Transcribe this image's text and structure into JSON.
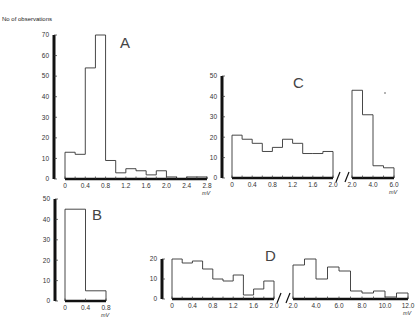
{
  "figure": {
    "ylabel": "No of observations",
    "unit": "mV"
  },
  "chart_data": [
    {
      "panel": "A",
      "type": "bar",
      "title": "A",
      "xlabel": "mV",
      "ylabel": "No of observations",
      "bin_width": 0.2,
      "categories": [
        "0-0.2",
        "0.2-0.4",
        "0.4-0.6",
        "0.6-0.8",
        "0.8-1.0",
        "1.0-1.2",
        "1.2-1.4",
        "1.4-1.6",
        "1.6-1.8",
        "1.8-2.0",
        "2.0-2.2",
        "2.2-2.4",
        "2.4-2.6",
        "2.6-2.8"
      ],
      "values": [
        13,
        12,
        54,
        70,
        9,
        3,
        5,
        4,
        2,
        4,
        1,
        0,
        1,
        1
      ],
      "xticks": [
        "0",
        "0.4",
        "0.8",
        "1.2",
        "1.6",
        "2.0",
        "2.4",
        "2.8"
      ],
      "yticks": [
        "0",
        "10",
        "20",
        "30",
        "40",
        "50",
        "60",
        "70"
      ],
      "ylim": [
        0,
        70
      ],
      "xlim": [
        0,
        2.8
      ]
    },
    {
      "panel": "B",
      "type": "bar",
      "title": "B",
      "xlabel": "mV",
      "bin_width": 0.4,
      "categories": [
        "0-0.4",
        "0.4-0.8"
      ],
      "values": [
        45,
        5
      ],
      "xticks": [
        "0",
        "0.4",
        "0.8"
      ],
      "yticks": [
        "0",
        "10",
        "20",
        "30",
        "40",
        "50"
      ],
      "ylim": [
        0,
        50
      ],
      "xlim": [
        0,
        0.8
      ]
    },
    {
      "panel": "C",
      "type": "bar",
      "title": "C",
      "xlabel": "mV",
      "broken_axis": true,
      "segments": [
        {
          "range": [
            0,
            2.0
          ],
          "bin_width": 0.2,
          "categories": [
            "0-0.2",
            "0.2-0.4",
            "0.4-0.6",
            "0.6-0.8",
            "0.8-1.0",
            "1.0-1.2",
            "1.2-1.4",
            "1.4-1.6",
            "1.6-1.8",
            "1.8-2.0"
          ],
          "values": [
            21,
            19,
            17,
            13,
            15,
            19,
            17,
            12,
            12,
            13
          ],
          "xticks": [
            "0",
            "0.4",
            "0.8",
            "1.2",
            "1.6",
            "2.0"
          ]
        },
        {
          "range": [
            2.0,
            6.0
          ],
          "bin_width": 1.0,
          "categories": [
            "2.0-3.0",
            "3.0-4.0",
            "4.0-5.0",
            "5.0-6.0"
          ],
          "values": [
            43,
            31,
            6,
            5
          ],
          "xticks": [
            "2.0",
            "4.0",
            "6.0"
          ]
        }
      ],
      "yticks": [
        "0",
        "10",
        "20",
        "30",
        "40",
        "50"
      ],
      "ylim": [
        0,
        50
      ]
    },
    {
      "panel": "D",
      "type": "bar",
      "title": "D",
      "xlabel": "mV",
      "broken_axis": true,
      "segments": [
        {
          "range": [
            0,
            2.0
          ],
          "bin_width": 0.2,
          "categories": [
            "0-0.2",
            "0.2-0.4",
            "0.4-0.6",
            "0.6-0.8",
            "0.8-1.0",
            "1.0-1.2",
            "1.2-1.4",
            "1.4-1.6",
            "1.6-1.8",
            "1.8-2.0"
          ],
          "values": [
            20,
            18,
            19,
            15,
            10,
            9,
            12,
            2,
            5,
            9
          ],
          "xticks": [
            "0",
            "0.4",
            "0.8",
            "1.2",
            "1.6",
            "2.0"
          ]
        },
        {
          "range": [
            2.0,
            12.0
          ],
          "bin_width": 1.0,
          "categories": [
            "2-3",
            "3-4",
            "4-5",
            "5-6",
            "6-7",
            "7-8",
            "8-9",
            "9-10",
            "10-11",
            "11-12"
          ],
          "values": [
            17,
            20,
            10,
            16,
            14,
            4,
            3,
            4,
            1,
            3
          ],
          "xticks": [
            "2.0",
            "4.0",
            "6.0",
            "8.0",
            "10.0",
            "12.0"
          ]
        }
      ],
      "yticks": [
        "0",
        "10",
        "20"
      ],
      "ylim": [
        0,
        20
      ]
    }
  ]
}
